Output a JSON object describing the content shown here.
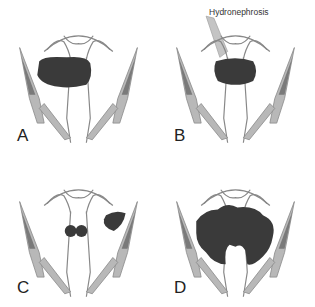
{
  "figure": {
    "panels": [
      {
        "id": "A",
        "label": "A",
        "description": "Large mass anterior to bladder/uterus region"
      },
      {
        "id": "B",
        "label": "B",
        "description": "Central mass with hydronephrosis",
        "annotation": "Hydronephrosis"
      },
      {
        "id": "C",
        "label": "C",
        "description": "Bilateral small masses with lateral mass"
      },
      {
        "id": "D",
        "label": "D",
        "description": "Extensive mass encasing structures"
      }
    ],
    "colors": {
      "mass": "#3a3a3a",
      "muscle_fill": "#b8b8b8",
      "muscle_texture": "#7a7a7a",
      "outline": "#888888",
      "hydronephrosis_fill": "#c4c4c4"
    }
  }
}
